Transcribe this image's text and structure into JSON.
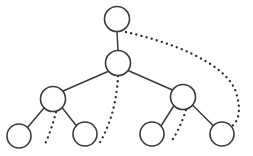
{
  "diagram": {
    "type": "node-link-tree",
    "canvas": {
      "width": 253,
      "height": 156,
      "background": "#ffffff"
    },
    "style": {
      "node_stroke_color": "#3a3a3a",
      "node_fill_color": "#ffffff",
      "node_stroke_width": 1.6,
      "solid_edge_color": "#3a3a3a",
      "solid_edge_width": 1.5,
      "dotted_edge_color": "#2b2b2b",
      "dotted_edge_width": 2.3,
      "dotted_edge_dash": "0.1 5.2",
      "node_radius": 12.5,
      "leaf_radius": 12
    },
    "nodes": [
      {
        "id": "n1",
        "label": "",
        "cx": 117,
        "cy": 19,
        "r": 12.5,
        "level": 0,
        "role": "root"
      },
      {
        "id": "n2",
        "label": "",
        "cx": 118,
        "cy": 63,
        "r": 12.5,
        "level": 1,
        "role": "internal"
      },
      {
        "id": "n3",
        "label": "",
        "cx": 53,
        "cy": 99,
        "r": 12.5,
        "level": 2,
        "role": "internal"
      },
      {
        "id": "n4",
        "label": "",
        "cx": 183,
        "cy": 97,
        "r": 12.5,
        "level": 2,
        "role": "internal"
      },
      {
        "id": "n5",
        "label": "",
        "cx": 19,
        "cy": 136,
        "r": 12,
        "level": 3,
        "role": "leaf"
      },
      {
        "id": "n6",
        "label": "",
        "cx": 85,
        "cy": 134,
        "r": 12,
        "level": 3,
        "role": "leaf"
      },
      {
        "id": "n7",
        "label": "",
        "cx": 152,
        "cy": 134,
        "r": 12,
        "level": 3,
        "role": "leaf"
      },
      {
        "id": "n8",
        "label": "",
        "cx": 222,
        "cy": 134,
        "r": 12,
        "level": 3,
        "role": "leaf"
      }
    ],
    "solid_edges": [
      {
        "id": "e1",
        "from": "n1",
        "to": "n2",
        "d": "M 117 31.5 L 118 50.5"
      },
      {
        "id": "e2",
        "from": "n2",
        "to": "n3",
        "d": "M 108.5 71.2 L 62.5 91.2"
      },
      {
        "id": "e3",
        "from": "n2",
        "to": "n4",
        "d": "M 128.0 70.5 L 172.5 90.0"
      },
      {
        "id": "e4",
        "from": "n3",
        "to": "n5",
        "d": "M 44.2 107.8 L 27.5 127.5"
      },
      {
        "id": "e5",
        "from": "n3",
        "to": "n6",
        "d": "M 62.0 107.5 L 76.5 126.0"
      },
      {
        "id": "e6",
        "from": "n4",
        "to": "n7",
        "d": "M 174.0 105.5 L 161.0 126.0"
      },
      {
        "id": "e7",
        "from": "n4",
        "to": "n8",
        "d": "M 192.5 105.0 L 213.5 126.0"
      }
    ],
    "dotted_edges": [
      {
        "id": "d1",
        "from": "n1",
        "to": "n8",
        "d": "M 126 32 C 170 42, 225 62, 236 92 C 242 112, 238 122, 231 127"
      },
      {
        "id": "d2",
        "from": "n2",
        "to": "n6_region",
        "d": "M 118 76 C 117 98, 112 122, 99 144"
      },
      {
        "id": "d3",
        "from": "n3",
        "to": "n5_region",
        "d": "M 56 112 C 53 124, 49 136, 44 146"
      },
      {
        "id": "d4",
        "from": "n4",
        "to": "n7_region",
        "d": "M 186 110 C 182 122, 177 134, 170 143"
      }
    ],
    "legend": {
      "solid_meaning": "direct parent-child edge",
      "dotted_meaning": "elided / implied path"
    }
  }
}
